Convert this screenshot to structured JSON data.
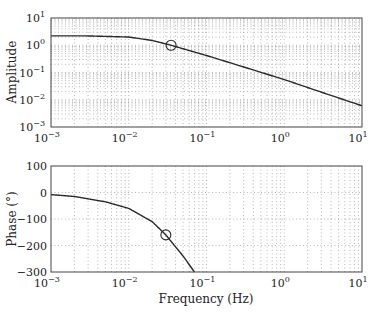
{
  "chart_data": [
    {
      "type": "line",
      "title": "",
      "xlabel": "",
      "ylabel": "Amplitude",
      "xscale": "log",
      "yscale": "log",
      "xlim": [
        0.001,
        10
      ],
      "ylim": [
        0.001,
        10
      ],
      "grid": true,
      "x_tick_labels": [
        "10^-3",
        "10^-2",
        "10^-1",
        "10^0",
        "10^1"
      ],
      "y_tick_labels": [
        "10^1",
        "10^0",
        "10^-1",
        "10^-2",
        "10^-3"
      ],
      "series": [
        {
          "name": "amplitude",
          "x": [
            0.001,
            0.003,
            0.01,
            0.02,
            0.035,
            0.1,
            0.3,
            1,
            3,
            10
          ],
          "values": [
            2.2,
            2.2,
            2.0,
            1.5,
            1.0,
            0.42,
            0.16,
            0.055,
            0.019,
            0.006
          ]
        }
      ],
      "annotations": [
        {
          "type": "circle-marker",
          "x": 0.035,
          "y": 1.0
        }
      ]
    },
    {
      "type": "line",
      "title": "",
      "xlabel": "Frequency (Hz)",
      "ylabel": "Phase (°)",
      "xscale": "log",
      "yscale": "linear",
      "xlim": [
        0.001,
        10
      ],
      "ylim": [
        -300,
        100
      ],
      "grid": true,
      "x_tick_labels": [
        "10^-3",
        "10^-2",
        "10^-1",
        "10^0",
        "10^1"
      ],
      "y_tick_labels": [
        "100",
        "0",
        "-100",
        "-200",
        "-300"
      ],
      "series": [
        {
          "name": "phase",
          "x": [
            0.001,
            0.002,
            0.005,
            0.01,
            0.02,
            0.03,
            0.05,
            0.07
          ],
          "values": [
            -8,
            -15,
            -35,
            -60,
            -110,
            -160,
            -240,
            -300
          ]
        }
      ],
      "annotations": [
        {
          "type": "circle-marker",
          "x": 0.03,
          "y": -160
        }
      ]
    }
  ],
  "labels": {
    "amp_ylabel": "Amplitude",
    "phase_ylabel": "Phase (°)",
    "xlabel": "Frequency (Hz)",
    "x_ticks": [
      {
        "base": "10",
        "exp": "−3"
      },
      {
        "base": "10",
        "exp": "−2"
      },
      {
        "base": "10",
        "exp": "−1"
      },
      {
        "base": "10",
        "exp": "0"
      },
      {
        "base": "10",
        "exp": "1"
      }
    ],
    "amp_y_ticks": [
      {
        "base": "10",
        "exp": "1"
      },
      {
        "base": "10",
        "exp": "0"
      },
      {
        "base": "10",
        "exp": "−1"
      },
      {
        "base": "10",
        "exp": "−2"
      },
      {
        "base": "10",
        "exp": "−3"
      }
    ],
    "phase_y_ticks": [
      "100",
      "0",
      "−100",
      "−200",
      "−300"
    ]
  }
}
